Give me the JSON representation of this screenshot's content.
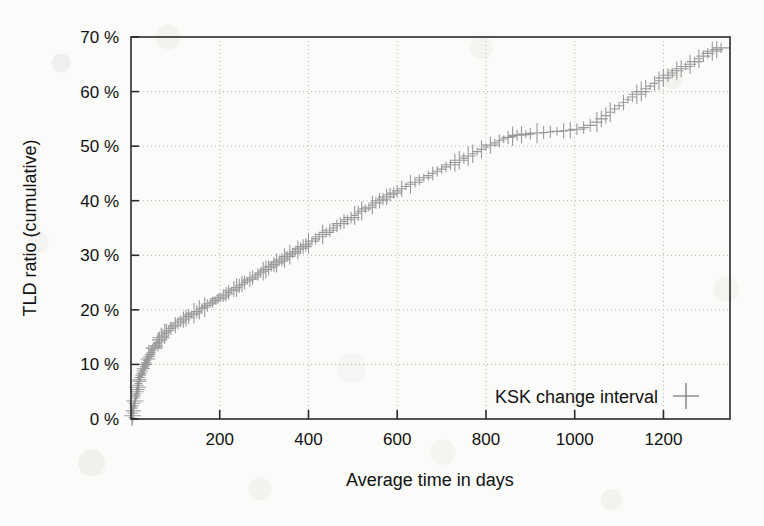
{
  "chart_data": {
    "type": "scatter",
    "title": "",
    "xlabel": "Average time in days",
    "ylabel": "TLD ratio (cumulative)",
    "xlim": [
      0,
      1350
    ],
    "ylim": [
      0,
      70
    ],
    "xticks": [
      200,
      400,
      600,
      800,
      1000,
      1200
    ],
    "xtick_labels": [
      "200",
      "400",
      "600",
      "800",
      "1000",
      "1200"
    ],
    "yticks": [
      0,
      10,
      20,
      30,
      40,
      50,
      60,
      70
    ],
    "ytick_labels": [
      "0 %",
      "10 %",
      "20 %",
      "30 %",
      "40 %",
      "50 %",
      "60 %",
      "70 %"
    ],
    "grid": "dotted",
    "grid_color": "#b4b4b0",
    "legend": {
      "position": "inside-bottom-right",
      "entries": [
        {
          "name": "KSK change interval",
          "marker": "plus",
          "color": "#8e8e8e"
        }
      ]
    },
    "series": [
      {
        "name": "KSK change interval",
        "marker": "plus",
        "color": "#8e8e8e",
        "points": [
          [
            2,
            0.2
          ],
          [
            3,
            0.6
          ],
          [
            4,
            1.1
          ],
          [
            5,
            1.5
          ],
          [
            6,
            2.0
          ],
          [
            7,
            2.4
          ],
          [
            8,
            2.9
          ],
          [
            9,
            3.3
          ],
          [
            10,
            3.8
          ],
          [
            11,
            4.2
          ],
          [
            12,
            4.6
          ],
          [
            13,
            5.0
          ],
          [
            14,
            5.4
          ],
          [
            15,
            5.8
          ],
          [
            16,
            6.2
          ],
          [
            17,
            6.5
          ],
          [
            18,
            6.9
          ],
          [
            19,
            7.2
          ],
          [
            20,
            7.6
          ],
          [
            22,
            8.0
          ],
          [
            24,
            8.4
          ],
          [
            26,
            8.8
          ],
          [
            28,
            9.2
          ],
          [
            30,
            9.6
          ],
          [
            32,
            10.0
          ],
          [
            34,
            10.3
          ],
          [
            36,
            10.7
          ],
          [
            38,
            11.0
          ],
          [
            40,
            11.4
          ],
          [
            43,
            11.8
          ],
          [
            46,
            12.2
          ],
          [
            49,
            12.6
          ],
          [
            52,
            13.0
          ],
          [
            55,
            13.4
          ],
          [
            58,
            13.8
          ],
          [
            61,
            14.1
          ],
          [
            64,
            14.5
          ],
          [
            68,
            14.9
          ],
          [
            72,
            15.2
          ],
          [
            76,
            15.6
          ],
          [
            80,
            15.9
          ],
          [
            85,
            16.2
          ],
          [
            90,
            16.6
          ],
          [
            95,
            16.9
          ],
          [
            100,
            17.2
          ],
          [
            106,
            17.6
          ],
          [
            112,
            17.9
          ],
          [
            118,
            18.2
          ],
          [
            124,
            18.5
          ],
          [
            130,
            18.8
          ],
          [
            136,
            19.1
          ],
          [
            142,
            19.4
          ],
          [
            148,
            19.7
          ],
          [
            154,
            20.0
          ],
          [
            160,
            20.3
          ],
          [
            166,
            20.5
          ],
          [
            172,
            20.8
          ],
          [
            178,
            21.1
          ],
          [
            184,
            21.4
          ],
          [
            190,
            21.7
          ],
          [
            196,
            22.0
          ],
          [
            202,
            22.3
          ],
          [
            208,
            22.6
          ],
          [
            214,
            22.9
          ],
          [
            220,
            23.2
          ],
          [
            226,
            23.5
          ],
          [
            232,
            23.8
          ],
          [
            238,
            24.1
          ],
          [
            244,
            24.4
          ],
          [
            250,
            24.7
          ],
          [
            256,
            25.0
          ],
          [
            262,
            25.3
          ],
          [
            268,
            25.6
          ],
          [
            274,
            25.9
          ],
          [
            280,
            26.2
          ],
          [
            286,
            26.5
          ],
          [
            292,
            26.8
          ],
          [
            298,
            27.1
          ],
          [
            304,
            27.4
          ],
          [
            310,
            27.7
          ],
          [
            316,
            28.0
          ],
          [
            322,
            28.3
          ],
          [
            328,
            28.6
          ],
          [
            334,
            28.9
          ],
          [
            340,
            29.2
          ],
          [
            346,
            29.5
          ],
          [
            352,
            29.8
          ],
          [
            358,
            30.1
          ],
          [
            364,
            30.4
          ],
          [
            370,
            30.7
          ],
          [
            376,
            31.0
          ],
          [
            382,
            31.3
          ],
          [
            388,
            31.6
          ],
          [
            394,
            31.9
          ],
          [
            400,
            32.2
          ],
          [
            408,
            32.6
          ],
          [
            416,
            33.0
          ],
          [
            424,
            33.4
          ],
          [
            432,
            33.8
          ],
          [
            440,
            34.2
          ],
          [
            448,
            34.6
          ],
          [
            456,
            35.0
          ],
          [
            464,
            35.4
          ],
          [
            472,
            35.8
          ],
          [
            480,
            36.2
          ],
          [
            488,
            36.5
          ],
          [
            496,
            36.9
          ],
          [
            504,
            37.3
          ],
          [
            512,
            37.7
          ],
          [
            520,
            38.1
          ],
          [
            528,
            38.5
          ],
          [
            536,
            38.8
          ],
          [
            544,
            39.2
          ],
          [
            552,
            39.6
          ],
          [
            560,
            40.0
          ],
          [
            568,
            40.3
          ],
          [
            576,
            40.7
          ],
          [
            584,
            41.1
          ],
          [
            592,
            41.4
          ],
          [
            600,
            41.8
          ],
          [
            610,
            42.2
          ],
          [
            620,
            42.6
          ],
          [
            630,
            43.0
          ],
          [
            640,
            43.4
          ],
          [
            650,
            43.8
          ],
          [
            660,
            44.2
          ],
          [
            670,
            44.6
          ],
          [
            680,
            45.0
          ],
          [
            690,
            45.4
          ],
          [
            700,
            45.8
          ],
          [
            710,
            46.2
          ],
          [
            720,
            46.6
          ],
          [
            730,
            47.0
          ],
          [
            740,
            47.4
          ],
          [
            750,
            47.8
          ],
          [
            760,
            48.2
          ],
          [
            770,
            48.6
          ],
          [
            780,
            49.0
          ],
          [
            790,
            49.4
          ],
          [
            800,
            49.8
          ],
          [
            810,
            50.2
          ],
          [
            820,
            50.6
          ],
          [
            830,
            51.0
          ],
          [
            840,
            51.3
          ],
          [
            850,
            51.6
          ],
          [
            860,
            51.8
          ],
          [
            870,
            52.0
          ],
          [
            880,
            52.1
          ],
          [
            890,
            52.2
          ],
          [
            900,
            52.3
          ],
          [
            915,
            52.4
          ],
          [
            930,
            52.5
          ],
          [
            945,
            52.6
          ],
          [
            960,
            52.7
          ],
          [
            975,
            52.8
          ],
          [
            990,
            52.9
          ],
          [
            1005,
            53.1
          ],
          [
            1020,
            53.4
          ],
          [
            1035,
            53.8
          ],
          [
            1050,
            54.4
          ],
          [
            1060,
            55.0
          ],
          [
            1070,
            55.6
          ],
          [
            1080,
            56.2
          ],
          [
            1090,
            56.8
          ],
          [
            1100,
            57.4
          ],
          [
            1110,
            58.0
          ],
          [
            1120,
            58.5
          ],
          [
            1130,
            59.0
          ],
          [
            1140,
            59.5
          ],
          [
            1150,
            60.0
          ],
          [
            1160,
            60.5
          ],
          [
            1170,
            61.0
          ],
          [
            1180,
            61.5
          ],
          [
            1190,
            62.0
          ],
          [
            1200,
            62.5
          ],
          [
            1210,
            63.0
          ],
          [
            1220,
            63.4
          ],
          [
            1230,
            63.8
          ],
          [
            1240,
            64.2
          ],
          [
            1250,
            64.6
          ],
          [
            1260,
            65.0
          ],
          [
            1270,
            65.5
          ],
          [
            1280,
            66.0
          ],
          [
            1290,
            66.5
          ],
          [
            1300,
            67.0
          ],
          [
            1310,
            67.4
          ],
          [
            1320,
            67.7
          ],
          [
            1330,
            68.0
          ]
        ]
      }
    ]
  }
}
